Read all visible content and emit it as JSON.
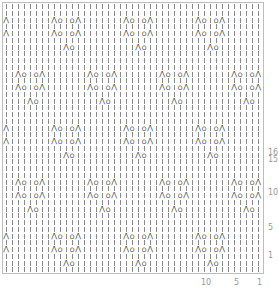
{
  "chart": {
    "title": "",
    "type": "knitting-lace-chart",
    "columns": 43,
    "rows": 40,
    "cell_width": 6,
    "cell_height": 6.75,
    "repeat": {
      "width": 12,
      "height": 16
    },
    "symbols": {
      "knit": "|",
      "yo": "O",
      "k2tog": "⋀",
      "ssk": "⋀"
    },
    "motifs": [
      {
        "row_in_repeat": 1,
        "col_offset": 3,
        "cells": [
          "k2tog",
          "yo"
        ]
      },
      {
        "row_in_repeat": 3,
        "col_offset": 1,
        "cells": [
          "k2tog",
          "yo",
          "knit",
          "yo",
          "ssk"
        ]
      },
      {
        "row_in_repeat": 5,
        "col_offset": 1,
        "cells": [
          "k2tog",
          "yo",
          "knit",
          "yo",
          "ssk"
        ]
      },
      {
        "row_in_repeat": 9,
        "col_offset": 9,
        "cells": [
          "k2tog",
          "yo"
        ]
      },
      {
        "row_in_repeat": 11,
        "col_offset": 7,
        "cells": [
          "k2tog",
          "yo",
          "knit",
          "yo",
          "ssk"
        ]
      },
      {
        "row_in_repeat": 13,
        "col_offset": 7,
        "cells": [
          "k2tog",
          "yo",
          "knit",
          "yo",
          "ssk"
        ]
      }
    ],
    "row_labels": [
      {
        "label": "16",
        "y": 149
      },
      {
        "label": "15",
        "y": 156
      },
      {
        "label": "10",
        "y": 189
      },
      {
        "label": "5",
        "y": 224
      },
      {
        "label": "1",
        "y": 252
      }
    ],
    "col_labels": [
      {
        "label": "10",
        "x": 201
      },
      {
        "label": "5",
        "x": 234
      },
      {
        "label": "1",
        "x": 257
      }
    ]
  }
}
